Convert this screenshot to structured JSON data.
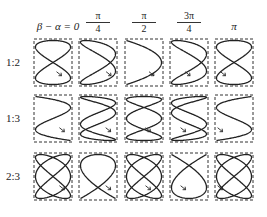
{
  "figure": {
    "column_headers": [
      {
        "type": "text",
        "label": "β − α = 0"
      },
      {
        "type": "frac",
        "num": "π",
        "den": "4"
      },
      {
        "type": "frac",
        "num": "π",
        "den": "2"
      },
      {
        "type": "frac",
        "num": "3π",
        "den": "4"
      },
      {
        "type": "text",
        "label": "π"
      }
    ],
    "phases": [
      0,
      0.7853981634,
      1.5707963268,
      2.3561944902,
      3.1415926536
    ],
    "rows": [
      {
        "label": "1:2",
        "fx": 2,
        "fy": 1
      },
      {
        "label": "1:3",
        "fx": 3,
        "fy": 1
      },
      {
        "label": "2:3",
        "fx": 3,
        "fy": 2
      }
    ],
    "layout": {
      "col_x": [
        34,
        79,
        125,
        170,
        215
      ],
      "row_y": [
        39,
        95,
        153
      ],
      "box_w": 38,
      "box_h": 47
    },
    "colors": {
      "curve": "#222222",
      "box": "#333333"
    }
  }
}
